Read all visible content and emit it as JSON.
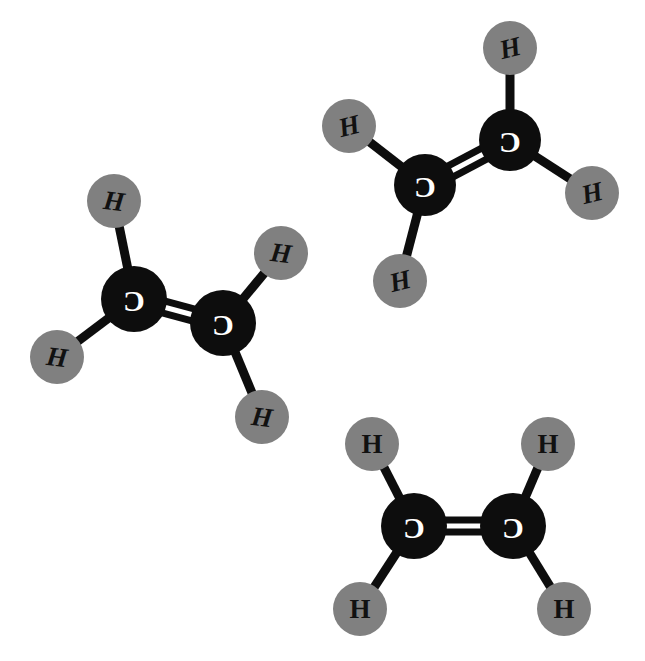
{
  "canvas": {
    "width": 645,
    "height": 661,
    "background": "#ffffff",
    "title": "Ethene molecules"
  },
  "style": {
    "carbon_fill": "#0d0d0d",
    "carbon_label_color": "#ffffff",
    "hydrogen_fill": "#808080",
    "hydrogen_label_color": "#111111",
    "bond_color": "#0d0d0d",
    "carbon_radius": 33,
    "hydrogen_radius": 27,
    "bond_width": 9,
    "double_bond_width": 7,
    "double_bond_gap": 12
  },
  "legend": {
    "carbon_symbol": "C",
    "hydrogen_symbol": "H",
    "molecule_formula": "C2H4",
    "molecule_name": "ethene",
    "molecule_count": 3
  },
  "molecules": [
    {
      "id": "molecule-left",
      "name": "ethene-left",
      "formula": "C2H4",
      "rotation_deg": 14,
      "atoms": [
        {
          "id": "m1-c1",
          "element": "C",
          "label": "C",
          "x": 134,
          "y": 299,
          "r": 33
        },
        {
          "id": "m1-c2",
          "element": "C",
          "label": "C",
          "x": 223,
          "y": 323,
          "r": 33
        },
        {
          "id": "m1-h1",
          "element": "H",
          "label": "H",
          "x": 114,
          "y": 201,
          "r": 27
        },
        {
          "id": "m1-h2",
          "element": "H",
          "label": "H",
          "x": 57,
          "y": 357,
          "r": 27
        },
        {
          "id": "m1-h3",
          "element": "H",
          "label": "H",
          "x": 281,
          "y": 253,
          "r": 27
        },
        {
          "id": "m1-h4",
          "element": "H",
          "label": "H",
          "x": 262,
          "y": 417,
          "r": 27
        }
      ],
      "bonds": [
        {
          "from": "m1-c1",
          "to": "m1-c2",
          "order": 2
        },
        {
          "from": "m1-c1",
          "to": "m1-h1",
          "order": 1
        },
        {
          "from": "m1-c1",
          "to": "m1-h2",
          "order": 1
        },
        {
          "from": "m1-c2",
          "to": "m1-h3",
          "order": 1
        },
        {
          "from": "m1-c2",
          "to": "m1-h4",
          "order": 1
        }
      ]
    },
    {
      "id": "molecule-top-right",
      "name": "ethene-top-right",
      "formula": "C2H4",
      "rotation_deg": -28,
      "atoms": [
        {
          "id": "m2-c1",
          "element": "C",
          "label": "C",
          "x": 425,
          "y": 185,
          "r": 31
        },
        {
          "id": "m2-c2",
          "element": "C",
          "label": "C",
          "x": 510,
          "y": 140,
          "r": 31
        },
        {
          "id": "m2-h1",
          "element": "H",
          "label": "H",
          "x": 349,
          "y": 126,
          "r": 27
        },
        {
          "id": "m2-h2",
          "element": "H",
          "label": "H",
          "x": 400,
          "y": 281,
          "r": 27
        },
        {
          "id": "m2-h3",
          "element": "H",
          "label": "H",
          "x": 510,
          "y": 48,
          "r": 27
        },
        {
          "id": "m2-h4",
          "element": "H",
          "label": "H",
          "x": 592,
          "y": 193,
          "r": 27
        }
      ],
      "bonds": [
        {
          "from": "m2-c1",
          "to": "m2-c2",
          "order": 2
        },
        {
          "from": "m2-c1",
          "to": "m2-h1",
          "order": 1
        },
        {
          "from": "m2-c1",
          "to": "m2-h2",
          "order": 1
        },
        {
          "from": "m2-c2",
          "to": "m2-h3",
          "order": 1
        },
        {
          "from": "m2-c2",
          "to": "m2-h4",
          "order": 1
        }
      ]
    },
    {
      "id": "molecule-bottom-right",
      "name": "ethene-bottom-right",
      "formula": "C2H4",
      "rotation_deg": 0,
      "atoms": [
        {
          "id": "m3-c1",
          "element": "C",
          "label": "C",
          "x": 414,
          "y": 526,
          "r": 33
        },
        {
          "id": "m3-c2",
          "element": "C",
          "label": "C",
          "x": 513,
          "y": 526,
          "r": 33
        },
        {
          "id": "m3-h1",
          "element": "H",
          "label": "H",
          "x": 372,
          "y": 444,
          "r": 27
        },
        {
          "id": "m3-h2",
          "element": "H",
          "label": "H",
          "x": 360,
          "y": 609,
          "r": 27
        },
        {
          "id": "m3-h3",
          "element": "H",
          "label": "H",
          "x": 548,
          "y": 444,
          "r": 27
        },
        {
          "id": "m3-h4",
          "element": "H",
          "label": "H",
          "x": 564,
          "y": 609,
          "r": 27
        }
      ],
      "bonds": [
        {
          "from": "m3-c1",
          "to": "m3-c2",
          "order": 2
        },
        {
          "from": "m3-c1",
          "to": "m3-h1",
          "order": 1
        },
        {
          "from": "m3-c1",
          "to": "m3-h2",
          "order": 1
        },
        {
          "from": "m3-c2",
          "to": "m3-h3",
          "order": 1
        },
        {
          "from": "m3-c2",
          "to": "m3-h4",
          "order": 1
        }
      ]
    }
  ]
}
